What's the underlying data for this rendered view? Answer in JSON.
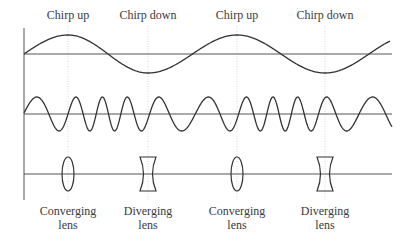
{
  "title_labels": [
    {
      "text": "Chirp up",
      "x": 68
    },
    {
      "text": "Chirp down",
      "x": 148
    },
    {
      "text": "Chirp up",
      "x": 237
    },
    {
      "text": "Chirp down",
      "x": 325
    }
  ],
  "lens_labels": [
    {
      "line1": "Converging",
      "line2": "lens",
      "x": 68
    },
    {
      "line1": "Diverging",
      "line2": "lens",
      "x": 148
    },
    {
      "line1": "Converging",
      "line2": "lens",
      "x": 237
    },
    {
      "line1": "Diverging",
      "line2": "lens",
      "x": 325
    }
  ],
  "lenses": [
    {
      "type": "converging",
      "x": 68
    },
    {
      "type": "diverging",
      "x": 148
    },
    {
      "type": "converging",
      "x": 237
    },
    {
      "type": "diverging",
      "x": 325
    }
  ],
  "colors": {
    "line": "#3a3a3a",
    "guide": "#cfcfcf"
  }
}
